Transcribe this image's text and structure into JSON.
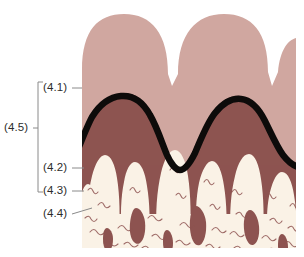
{
  "figure": {
    "type": "anatomical-cross-section-diagram",
    "title": "",
    "background_color": "#ffffff",
    "width": 304,
    "height": 257,
    "layers": [
      {
        "key": "4.1",
        "name": "superficial-pink-layer",
        "color": "#d0a7a0",
        "description": "light dusty-pink lobed surface layer with two full rounded lobes and a third partial lobe at the right edge"
      },
      {
        "key": "4.2",
        "name": "black-boundary-line",
        "color": "#0d0b0a",
        "description": "thick undulating black boundary line separating the pink layer from the maroon layer"
      },
      {
        "key": "4.3",
        "name": "deep-maroon-layer",
        "color": "#8d5450",
        "description": "deep maroon / brownish-red layer below the black boundary line"
      },
      {
        "key": "4.4",
        "name": "cream-papillae-layer",
        "color": "#faf2e6",
        "description": "cream-ivory finger-like papillae with fine squiggly line texture projecting upward from the base"
      },
      {
        "key": "4.5",
        "name": "overall-bracketed-region",
        "color": "#7a7a7a",
        "description": "bracket spanning the combined pink, black-line and maroon layers"
      }
    ],
    "leader_color": "#8a8a8a",
    "bracket_color": "#8a8a8a"
  },
  "callouts": {
    "c41": "(4.1)",
    "c42": "(4.2)",
    "c43": "(4.3)",
    "c44": "(4.4)",
    "c45": "(4.5)"
  }
}
